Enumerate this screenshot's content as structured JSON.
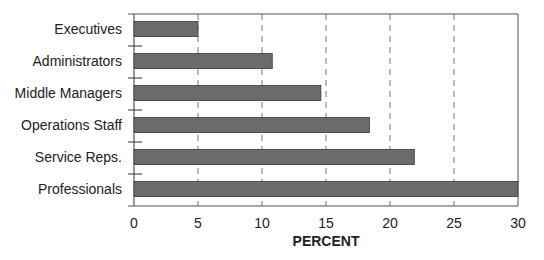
{
  "chart_data": {
    "type": "bar",
    "orientation": "horizontal",
    "title": "",
    "xlabel": "PERCENT",
    "ylabel": "",
    "categories": [
      "Executives",
      "Administrators",
      "Middle Managers",
      "Operations Staff",
      "Service Reps.",
      "Professionals"
    ],
    "values": [
      5.0,
      10.8,
      14.6,
      18.4,
      21.9,
      30.0
    ],
    "xlim": [
      0,
      30
    ],
    "xticks": [
      0,
      5,
      10,
      15,
      20,
      25,
      30
    ],
    "grid": "vertical dashed at 5,10,15,20,25",
    "legend": "none",
    "colors": {
      "bar": "#6b6b6b",
      "bar_stroke": "#3a3a3a",
      "axis": "#555555",
      "grid": "#777777"
    }
  }
}
